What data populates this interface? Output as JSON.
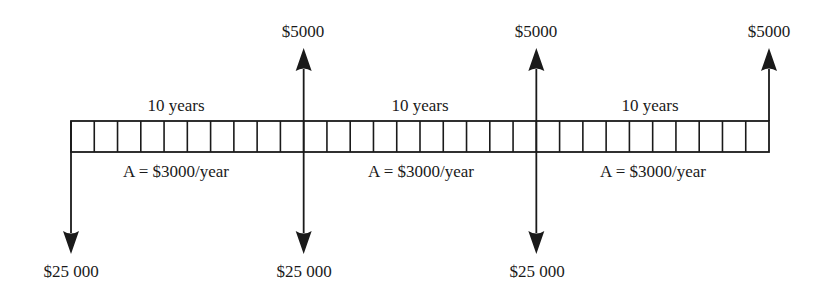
{
  "diagram": {
    "type": "cash-flow-diagram",
    "colors": {
      "ink": "#1a1a1a",
      "background": "#ffffff"
    },
    "timeline": {
      "x_start": 71,
      "x_end": 769,
      "y_top": 121,
      "y_bottom": 152,
      "total_periods": 30,
      "segments": [
        {
          "duration_label": "10 years",
          "annuity_label": "A = $3000/year",
          "periods": 10
        },
        {
          "duration_label": "10 years",
          "annuity_label": "A = $3000/year",
          "periods": 10
        },
        {
          "duration_label": "10 years",
          "annuity_label": "A = $3000/year",
          "periods": 10
        }
      ]
    },
    "cash_flows": [
      {
        "period": 0,
        "direction": "down",
        "amount_label": "$25 000"
      },
      {
        "period": 10,
        "direction": "up",
        "amount_label": "$5000"
      },
      {
        "period": 10,
        "direction": "down",
        "amount_label": "$25 000"
      },
      {
        "period": 20,
        "direction": "up",
        "amount_label": "$5000"
      },
      {
        "period": 20,
        "direction": "down",
        "amount_label": "$25 000"
      },
      {
        "period": 30,
        "direction": "up",
        "amount_label": "$5000"
      }
    ]
  },
  "labels": {
    "up_1": "$5000",
    "up_2": "$5000",
    "up_3": "$5000",
    "down_1": "$25 000",
    "down_2": "$25 000",
    "down_3": "$25 000",
    "years_1": "10 years",
    "years_2": "10 years",
    "years_3": "10 years",
    "annuity_1": "A = $3000/year",
    "annuity_2": "A = $3000/year",
    "annuity_3": "A = $3000/year"
  }
}
